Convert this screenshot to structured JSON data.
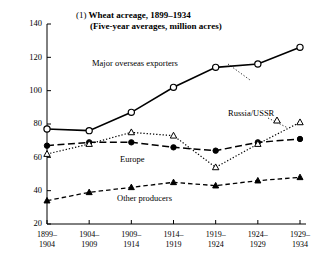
{
  "title": {
    "number": "(1)",
    "line1": "Wheat acreage, 1899–1934",
    "line2": "(Five-year averages, million acres)"
  },
  "annotations": {
    "exporters": "Major overseas exporters",
    "europe": "Europe",
    "russia": "Russia/USSR",
    "other": "Other producers"
  },
  "chart_data": {
    "type": "line",
    "title": "(1) Wheat acreage, 1899–1934 (Five-year averages, million acres)",
    "xlabel": "",
    "ylabel": "",
    "ylim": [
      20,
      140
    ],
    "yticks": [
      20,
      40,
      60,
      80,
      100,
      120,
      140
    ],
    "ytick_labels": [
      "20",
      "40",
      "60",
      "80",
      "100",
      "120",
      "140"
    ],
    "grid": false,
    "legend": "inline-annotations",
    "categories": [
      "1899–\n1904",
      "1904–\n1909",
      "1909–\n1914",
      "1914–\n1919",
      "1919–\n1924",
      "1924–\n1929",
      "1929–\n1934"
    ],
    "xtick_labels_top": [
      "1899–",
      "1904–",
      "1909–",
      "1914–",
      "1919–",
      "1924–",
      "1929–"
    ],
    "xtick_labels_bottom": [
      "1904",
      "1909",
      "1914",
      "1919",
      "1924",
      "1929",
      "1934"
    ],
    "series": [
      {
        "name": "Major overseas exporters",
        "marker": "open-circle",
        "line": "solid",
        "values": [
          77,
          76,
          87,
          102,
          114,
          116,
          126
        ]
      },
      {
        "name": "Europe",
        "marker": "filled-circle",
        "line": "dashed",
        "values": [
          67,
          69,
          69,
          66,
          64,
          69,
          71
        ]
      },
      {
        "name": "Russia/USSR",
        "marker": "open-triangle",
        "line": "dotted",
        "values": [
          62,
          68,
          75,
          73,
          54,
          68,
          81
        ]
      },
      {
        "name": "Other producers",
        "marker": "filled-triangle",
        "line": "dashed",
        "values": [
          34,
          39,
          42,
          45,
          43,
          46,
          48
        ]
      }
    ]
  }
}
